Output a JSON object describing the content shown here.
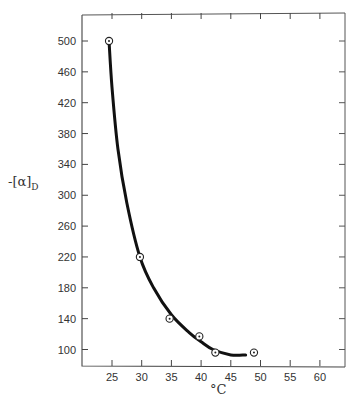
{
  "chart_data": {
    "type": "scatter",
    "title": "",
    "xlabel": "°C",
    "ylabel": "-[α]D",
    "xlim": [
      20,
      64
    ],
    "ylim": [
      80,
      545
    ],
    "xticks": [
      25,
      30,
      35,
      40,
      45,
      50,
      55,
      60
    ],
    "yticks": [
      100,
      140,
      180,
      220,
      260,
      300,
      340,
      380,
      420,
      460,
      500
    ],
    "grid": false,
    "legend": null,
    "series": [
      {
        "name": "measured",
        "marker": "circled-dot",
        "x": [
          24.5,
          29.7,
          34.7,
          39.7,
          42.4,
          48.9
        ],
        "y": [
          500,
          220,
          140,
          117,
          96,
          96
        ]
      },
      {
        "name": "fitted-curve",
        "style": "thick-solid",
        "x": [
          24.5,
          25.0,
          26.0,
          27.5,
          29.7,
          32.0,
          35.0,
          38.0,
          40.0,
          42.0,
          45.0,
          47.5
        ],
        "y": [
          500,
          440,
          360,
          290,
          220,
          180,
          145,
          122,
          110,
          100,
          93,
          93
        ]
      }
    ]
  },
  "labels": {
    "xlabel": "°C",
    "ylabel_main": "-[α]",
    "ylabel_sub": "D"
  }
}
